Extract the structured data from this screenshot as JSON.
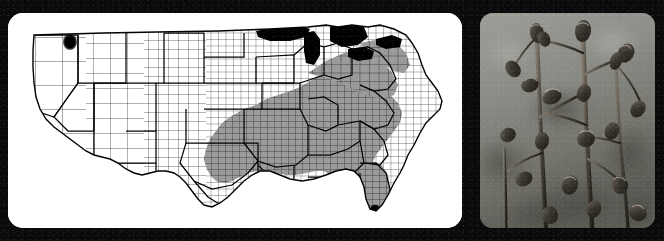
{
  "figure": {
    "width": 664,
    "height": 241,
    "background_color": "#0a0a0a",
    "panel_count": 2,
    "panel_shape": "rounded-rectangle"
  },
  "map_panel": {
    "name": "county-distribution-map",
    "type": "choropleth-county-map",
    "region": "Contiguous United States",
    "background_color": "#ffffff",
    "county_outline_color": "#222222",
    "state_outline_color": "#000000",
    "shaded_fill_color": "#9a9a9a",
    "point_marker_color": "#000000",
    "water_fill_color": "#000000",
    "bounds": {
      "x": 8,
      "y": 13,
      "width": 454,
      "height": 215
    },
    "legend_classes": [
      {
        "label": "county record (shaded)",
        "color": "#9a9a9a"
      },
      {
        "label": "isolated point record",
        "color": "#000000"
      },
      {
        "label": "no record",
        "color": "#ffffff"
      }
    ],
    "shaded_states": [
      "Texas (east)",
      "Oklahoma (southeast)",
      "Arkansas",
      "Louisiana",
      "Mississippi",
      "Alabama",
      "Georgia",
      "Florida",
      "South Carolina",
      "North Carolina",
      "Tennessee",
      "Kentucky (south)",
      "Virginia",
      "West Virginia (south)",
      "Maryland",
      "Delaware"
    ],
    "point_records": [
      {
        "label": "northern Rocky Mountain outlier",
        "x": 62,
        "y": 29
      },
      {
        "label": "southern Florida outlier",
        "x": 392,
        "y": 196
      }
    ],
    "water_bodies": [
      "Lake Superior",
      "Lake Michigan",
      "Lake Huron",
      "Lake Erie",
      "Lake Ontario"
    ]
  },
  "photo_panel": {
    "name": "plant-photograph",
    "type": "black-and-white-photograph",
    "subject": "dried flowering plant stems bearing seed capsules",
    "background_description": "blurred out-of-focus field",
    "background_color": "#8a8a86",
    "stem_color": "#3a352e",
    "capsule_color": "#2a2620",
    "bounds": {
      "x": 480,
      "y": 13,
      "width": 175,
      "height": 215
    }
  }
}
